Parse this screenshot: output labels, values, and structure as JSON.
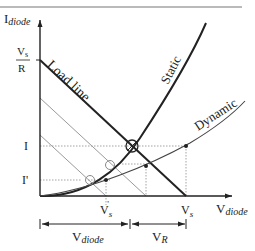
{
  "diagram": {
    "type": "diode-load-line",
    "y_axis": {
      "label_main": "I",
      "label_sub": "diode"
    },
    "x_axis": {
      "label_main": "V",
      "label_sub": "diode"
    },
    "y_ticks": {
      "vs_over_r_num": "V",
      "vs_over_r_num_sub": "s",
      "vs_over_r_den": "R",
      "i": "I",
      "i_prime": "I'"
    },
    "x_ticks": {
      "vs_prime_main": "V",
      "vs_prime_sub": "s",
      "vs_prime_mark": "'",
      "vs_main": "V",
      "vs_sub": "s"
    },
    "curves": {
      "load_line": "Load line",
      "static": "Static",
      "dynamic": "Dynamic"
    },
    "dimensions": {
      "v_diode_main": "V",
      "v_diode_sub": "diode",
      "v_r_main": "V",
      "v_r_sub": "R"
    },
    "colors": {
      "ink": "#222222",
      "thin": "#9a9a9a",
      "rule": "#777777"
    }
  }
}
